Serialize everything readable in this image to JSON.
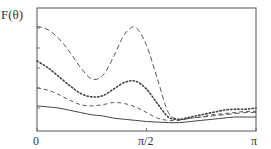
{
  "chart_data": {
    "type": "line",
    "title": "",
    "ylabel": "F(θ)",
    "xlabel": "",
    "x_ticks": [
      {
        "value": 0,
        "label": "0"
      },
      {
        "value": 1.5708,
        "label": "π/2"
      },
      {
        "value": 3.1416,
        "label": "π"
      }
    ],
    "xlim": [
      0,
      3.1416
    ],
    "ylim": [
      0,
      1
    ],
    "y_tick_labels": [],
    "grid": false,
    "legend": null,
    "x": [
      0.0,
      0.157,
      0.314,
      0.471,
      0.628,
      0.785,
      0.942,
      1.1,
      1.257,
      1.414,
      1.571,
      1.728,
      1.885,
      2.042,
      2.199,
      2.356,
      2.513,
      2.67,
      2.827,
      2.985,
      3.142
    ],
    "series": [
      {
        "name": "long-dash",
        "style": "dashed-long",
        "values": [
          0.89,
          0.86,
          0.78,
          0.66,
          0.52,
          0.42,
          0.45,
          0.62,
          0.82,
          0.88,
          0.72,
          0.42,
          0.12,
          0.06,
          0.07,
          0.08,
          0.09,
          0.1,
          0.11,
          0.12,
          0.12
        ]
      },
      {
        "name": "dotted",
        "style": "dotted",
        "values": [
          0.58,
          0.52,
          0.44,
          0.36,
          0.29,
          0.26,
          0.27,
          0.33,
          0.39,
          0.4,
          0.33,
          0.2,
          0.08,
          0.06,
          0.08,
          0.1,
          0.12,
          0.14,
          0.15,
          0.15,
          0.16
        ]
      },
      {
        "name": "short-dash",
        "style": "dashed-short",
        "values": [
          0.34,
          0.32,
          0.28,
          0.23,
          0.19,
          0.18,
          0.19,
          0.21,
          0.2,
          0.17,
          0.12,
          0.07,
          0.05,
          0.05,
          0.07,
          0.08,
          0.1,
          0.11,
          0.12,
          0.13,
          0.13
        ]
      },
      {
        "name": "solid",
        "style": "solid",
        "values": [
          0.18,
          0.17,
          0.16,
          0.14,
          0.12,
          0.1,
          0.09,
          0.07,
          0.06,
          0.05,
          0.04,
          0.035,
          0.03,
          0.03,
          0.04,
          0.05,
          0.06,
          0.07,
          0.08,
          0.08,
          0.08
        ]
      }
    ]
  },
  "axes": {
    "ylabel": "F(θ)",
    "x0": "0",
    "xmid": "π/2",
    "xmax": "π"
  }
}
